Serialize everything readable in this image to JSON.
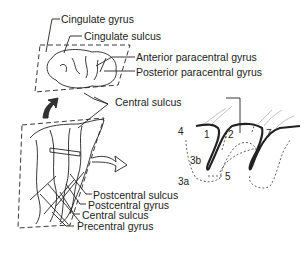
{
  "labels": {
    "cingulate_gyrus": "Cingulate gyrus",
    "cingulate_sulcus": "Cingulate sulcus",
    "anterior_paracentral_gyrus": "Anterior paracentral gyrus",
    "posterior_paracentral_gyrus": "Posterior paracentral gyrus",
    "central_sulcus_top": "Central sulcus",
    "postcentral_sulcus": "Postcentral sulcus",
    "postcentral_gyrus": "Postcentral gyrus",
    "central_sulcus_bottom": "Central sulcus",
    "precentral_gyrus": "Precentral gyrus"
  },
  "areas": [
    "4",
    "1",
    "2",
    "7",
    "3b",
    "3a",
    "5"
  ]
}
